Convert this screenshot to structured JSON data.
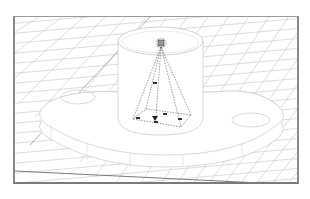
{
  "viewport": {
    "type": "3d-perspective-viewport",
    "frame_color": "#8a8a8a",
    "grid_color": "#c8c8c8",
    "ground_edge_color": "#7a7a7a",
    "model_line_color": "#d0d0d0",
    "frustum_color": "#555555"
  },
  "scene": {
    "objects": [
      {
        "name": "flange-base",
        "description": "oval flange plate with two bolt holes"
      },
      {
        "name": "cylinder-boss",
        "description": "vertical cylinder on top of flange"
      },
      {
        "name": "spotlight-gizmo",
        "description": "dashed pyramid light/camera frustum inside cylinder"
      },
      {
        "name": "ground-grid",
        "description": "perspective ground plane grid"
      }
    ]
  }
}
